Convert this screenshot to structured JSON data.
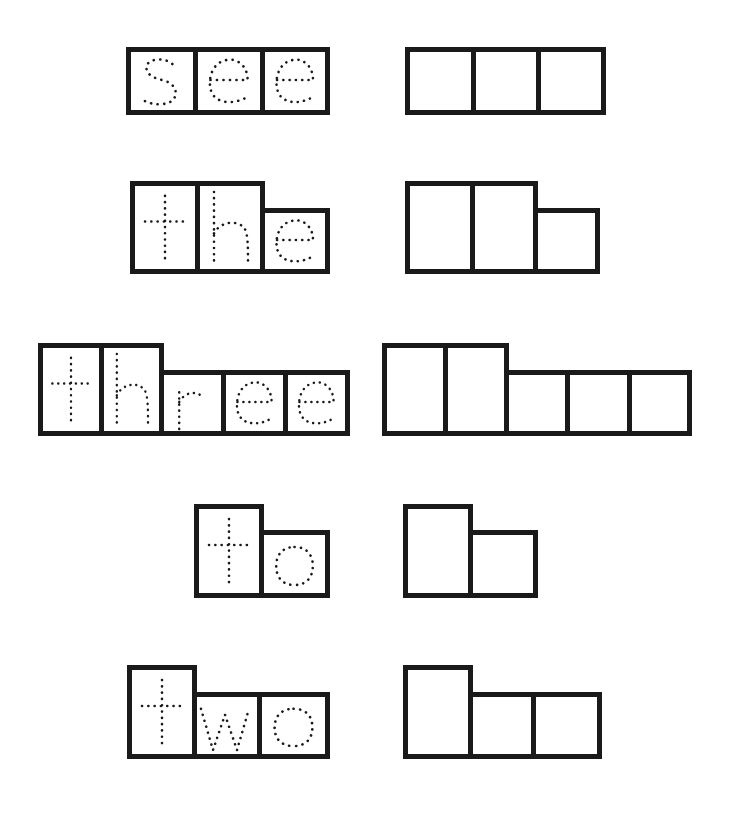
{
  "worksheet": {
    "type": "word-shape tracing worksheet",
    "stroke_color": "#1a1a1a",
    "background": "#ffffff",
    "words": [
      {
        "word": "see",
        "letters": [
          {
            "char": "s",
            "shape": "short",
            "x": 126,
            "y": 47,
            "w": 72,
            "h": 68
          },
          {
            "char": "e",
            "shape": "short",
            "x": 193,
            "y": 47,
            "w": 72,
            "h": 68
          },
          {
            "char": "e",
            "shape": "short",
            "x": 260,
            "y": 47,
            "w": 70,
            "h": 68
          }
        ],
        "blank_boxes": [
          {
            "shape": "short",
            "x": 405,
            "y": 47,
            "w": 71,
            "h": 68
          },
          {
            "shape": "short",
            "x": 471,
            "y": 47,
            "w": 70,
            "h": 68
          },
          {
            "shape": "short",
            "x": 536,
            "y": 47,
            "w": 70,
            "h": 68
          }
        ]
      },
      {
        "word": "the",
        "letters": [
          {
            "char": "t",
            "shape": "tall",
            "x": 130,
            "y": 181,
            "w": 70,
            "h": 93
          },
          {
            "char": "h",
            "shape": "tall",
            "x": 195,
            "y": 181,
            "w": 70,
            "h": 93
          },
          {
            "char": "e",
            "shape": "short",
            "x": 260,
            "y": 208,
            "w": 70,
            "h": 66
          }
        ],
        "blank_boxes": [
          {
            "shape": "tall",
            "x": 405,
            "y": 181,
            "w": 70,
            "h": 93
          },
          {
            "shape": "tall",
            "x": 470,
            "y": 181,
            "w": 68,
            "h": 93
          },
          {
            "shape": "short",
            "x": 533,
            "y": 208,
            "w": 67,
            "h": 66
          }
        ]
      },
      {
        "word": "three",
        "letters": [
          {
            "char": "t",
            "shape": "tall",
            "x": 38,
            "y": 343,
            "w": 66,
            "h": 93
          },
          {
            "char": "h",
            "shape": "tall",
            "x": 99,
            "y": 343,
            "w": 65,
            "h": 93
          },
          {
            "char": "r",
            "shape": "short",
            "x": 159,
            "y": 370,
            "w": 67,
            "h": 66
          },
          {
            "char": "e",
            "shape": "short",
            "x": 221,
            "y": 370,
            "w": 67,
            "h": 66
          },
          {
            "char": "e",
            "shape": "short",
            "x": 283,
            "y": 370,
            "w": 67,
            "h": 66
          }
        ],
        "blank_boxes": [
          {
            "shape": "tall",
            "x": 382,
            "y": 343,
            "w": 66,
            "h": 93
          },
          {
            "shape": "tall",
            "x": 443,
            "y": 343,
            "w": 66,
            "h": 93
          },
          {
            "shape": "short",
            "x": 504,
            "y": 370,
            "w": 66,
            "h": 66
          },
          {
            "shape": "short",
            "x": 565,
            "y": 370,
            "w": 67,
            "h": 66
          },
          {
            "shape": "short",
            "x": 627,
            "y": 370,
            "w": 65,
            "h": 66
          }
        ]
      },
      {
        "word": "to",
        "letters": [
          {
            "char": "t",
            "shape": "tall",
            "x": 194,
            "y": 504,
            "w": 70,
            "h": 94
          },
          {
            "char": "o",
            "shape": "short",
            "x": 259,
            "y": 530,
            "w": 71,
            "h": 68
          }
        ],
        "blank_boxes": [
          {
            "shape": "tall",
            "x": 403,
            "y": 504,
            "w": 70,
            "h": 94
          },
          {
            "shape": "short",
            "x": 468,
            "y": 530,
            "w": 70,
            "h": 68
          }
        ]
      },
      {
        "word": "two",
        "letters": [
          {
            "char": "t",
            "shape": "tall",
            "x": 127,
            "y": 665,
            "w": 70,
            "h": 94
          },
          {
            "char": "w",
            "shape": "short",
            "x": 192,
            "y": 692,
            "w": 70,
            "h": 67
          },
          {
            "char": "o",
            "shape": "short",
            "x": 257,
            "y": 692,
            "w": 73,
            "h": 67
          }
        ],
        "blank_boxes": [
          {
            "shape": "tall",
            "x": 403,
            "y": 665,
            "w": 70,
            "h": 94
          },
          {
            "shape": "short",
            "x": 468,
            "y": 692,
            "w": 68,
            "h": 67
          },
          {
            "shape": "short",
            "x": 531,
            "y": 692,
            "w": 71,
            "h": 67
          }
        ]
      }
    ]
  }
}
